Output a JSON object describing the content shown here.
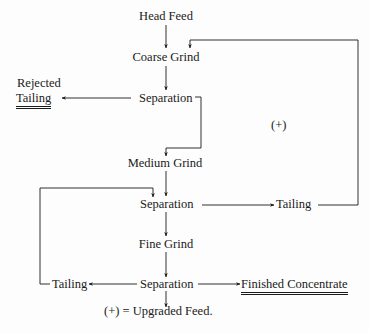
{
  "diagram": {
    "type": "process-flow",
    "nodes": {
      "head_feed": "Head Feed",
      "coarse_grind": "Coarse Grind",
      "separation_1": "Separation",
      "rejected_tailing_line1": "Rejected",
      "rejected_tailing_line2": "Tailing",
      "medium_grind": "Medium Grind",
      "separation_2": "Separation",
      "tailing_2": "Tailing",
      "fine_grind": "Fine Grind",
      "separation_3": "Separation",
      "tailing_3": "Tailing",
      "finished_concentrate": "Finished Concentrate",
      "upgraded_feed_marker": "(+)",
      "legend": "(+) = Upgraded Feed."
    },
    "edges": [
      {
        "from": "Head Feed",
        "to": "Coarse Grind"
      },
      {
        "from": "Coarse Grind",
        "to": "Separation 1"
      },
      {
        "from": "Separation 1",
        "to": "Rejected Tailing"
      },
      {
        "from": "Separation 1",
        "to": "Medium Grind"
      },
      {
        "from": "Medium Grind",
        "to": "Separation 2"
      },
      {
        "from": "Separation 2",
        "to": "Tailing 2"
      },
      {
        "from": "Tailing 2",
        "to": "Coarse Grind",
        "label": "(+)"
      },
      {
        "from": "Separation 2",
        "to": "Fine Grind"
      },
      {
        "from": "Fine Grind",
        "to": "Separation 3"
      },
      {
        "from": "Separation 3",
        "to": "Tailing 3"
      },
      {
        "from": "Tailing 3",
        "to": "Separation 2"
      },
      {
        "from": "Separation 3",
        "to": "Finished Concentrate"
      },
      {
        "from": "Separation 3",
        "to": "Upgraded Feed"
      }
    ],
    "colors": {
      "ink": "#1a1a1a",
      "background": "#fdfdfd"
    }
  }
}
